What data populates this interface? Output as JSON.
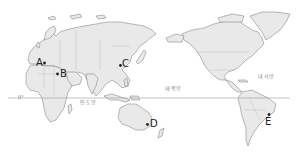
{
  "map": {
    "type": "world-map-pacific-centered",
    "equator_label": "0°",
    "oceans": [
      {
        "name": "pacific",
        "label": "태평양"
      },
      {
        "name": "atlantic",
        "label": "대서양"
      },
      {
        "name": "indian",
        "label": "인도양"
      }
    ],
    "points": [
      {
        "id": "A",
        "label": "A"
      },
      {
        "id": "B",
        "label": "B"
      },
      {
        "id": "C",
        "label": "C"
      },
      {
        "id": "D",
        "label": "D"
      },
      {
        "id": "E",
        "label": "E"
      }
    ],
    "colors": {
      "land": "#e9e9e9",
      "coast": "#8a8a8a",
      "marker": "#222222",
      "equator": "#9a9a9a"
    }
  }
}
